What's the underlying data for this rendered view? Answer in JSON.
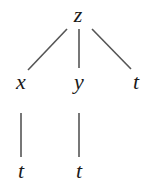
{
  "diagram": {
    "type": "tree",
    "nodes": [
      {
        "id": "z",
        "label": "z"
      },
      {
        "id": "x",
        "label": "x"
      },
      {
        "id": "y",
        "label": "y"
      },
      {
        "id": "t1",
        "label": "t"
      },
      {
        "id": "t2",
        "label": "t"
      },
      {
        "id": "t3",
        "label": "t"
      }
    ],
    "edges": [
      {
        "from": "z",
        "to": "x"
      },
      {
        "from": "z",
        "to": "y"
      },
      {
        "from": "z",
        "to": "t1"
      },
      {
        "from": "x",
        "to": "t2"
      },
      {
        "from": "y",
        "to": "t3"
      }
    ]
  }
}
